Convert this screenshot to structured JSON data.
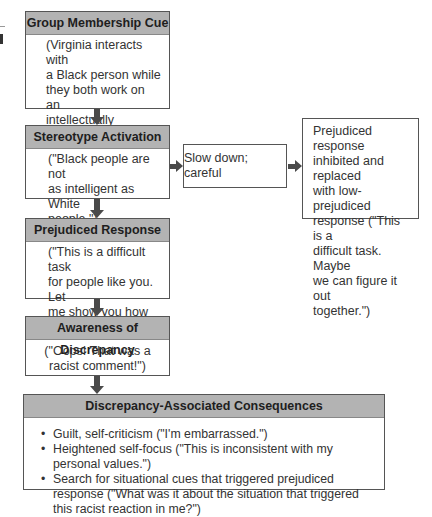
{
  "diagram": {
    "main_flow": [
      {
        "title": "Group Membership Cue",
        "text": "(Virginia interacts with a Black person while they both work on an intellectually challenging task.)",
        "lines": [
          "(Virginia interacts with",
          "a Black person while",
          "they both work on an",
          "intellectually",
          "challenging task.)"
        ]
      },
      {
        "title": "Stereotype Activation",
        "lines": [
          "(\"Black people are not",
          "as intelligent as White",
          "people.\")"
        ]
      },
      {
        "title": "Prejudiced Response",
        "lines": [
          "(\"This is a difficult task",
          "for people like you. Let",
          "me show you how to",
          "figure it out.\")"
        ]
      },
      {
        "title": "Awareness of Discrepancy",
        "lines": [
          "(\"Oops! That was a",
          "racist comment!\")"
        ]
      }
    ],
    "side_flow": {
      "slow_down": "Slow down; careful",
      "inhibited": {
        "lines": [
          "Prejudiced response",
          "inhibited and replaced",
          "with low-prejudiced",
          "response (\"This is a",
          "difficult task. Maybe",
          "we can figure it out",
          "together.\")"
        ]
      }
    },
    "consequences": {
      "title": "Discrepancy-Associated Consequences",
      "items": [
        "Guilt, self-criticism (\"I'm embarrassed.\")",
        "Heightened self-focus (\"This is inconsistent with my personal values.\")",
        "Search for situational cues that triggered prejudiced response (\"What was it about the situation that triggered this racist reaction in me?\")"
      ]
    }
  },
  "colors": {
    "header_fill": "#b3b3b3",
    "arrow": "#4a4a4a",
    "border": "#555555"
  }
}
